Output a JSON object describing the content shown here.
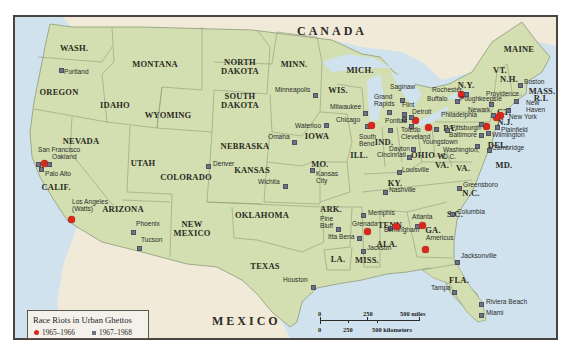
{
  "legend": {
    "title": "Race Riots in Urban Ghettos",
    "items": [
      {
        "label": "1965–1966",
        "marker": "red-dot",
        "color": "#d8271d"
      },
      {
        "label": "1967–1968",
        "marker": "gray-square",
        "color": "#6e7384"
      }
    ]
  },
  "scale": {
    "miles": [
      "0",
      "250",
      "500 miles"
    ],
    "kilometers": [
      "0",
      "250",
      "500 kilometers"
    ]
  },
  "countries": {
    "canada": "CANADA",
    "mexico": "MEXICO"
  },
  "colors": {
    "land": "#d3dfb0",
    "water": "#cfe2ee",
    "foreign_land": "#f1ead8",
    "riot_1965_1966": "#d8271d",
    "riot_1967_1968": "#6e7384"
  },
  "states": [
    {
      "id": "wash",
      "label": "WASH.",
      "x": 72,
      "y": 46
    },
    {
      "id": "oregon",
      "label": "OREGON",
      "x": 57,
      "y": 90
    },
    {
      "id": "idaho",
      "label": "IDAHO",
      "x": 113,
      "y": 103
    },
    {
      "id": "montana",
      "label": "MONTANA",
      "x": 153,
      "y": 62
    },
    {
      "id": "wyoming",
      "label": "WYOMING",
      "x": 166,
      "y": 113
    },
    {
      "id": "north-dakota",
      "label": "NORTH\nDAKOTA",
      "x": 238,
      "y": 60
    },
    {
      "id": "south-dakota",
      "label": "SOUTH\nDAKOTA",
      "x": 238,
      "y": 94
    },
    {
      "id": "minn",
      "label": "MINN.",
      "x": 292,
      "y": 62
    },
    {
      "id": "wis",
      "label": "WIS.",
      "x": 336,
      "y": 88
    },
    {
      "id": "mich",
      "label": "MICH.",
      "x": 358,
      "y": 68
    },
    {
      "id": "nevada",
      "label": "NEVADA",
      "x": 79,
      "y": 139
    },
    {
      "id": "calif",
      "label": "CALIF.",
      "x": 54,
      "y": 185
    },
    {
      "id": "utah",
      "label": "UTAH",
      "x": 141,
      "y": 161
    },
    {
      "id": "colorado",
      "label": "COLORADO",
      "x": 184,
      "y": 175
    },
    {
      "id": "arizona",
      "label": "ARIZONA",
      "x": 121,
      "y": 207
    },
    {
      "id": "new-mexico",
      "label": "NEW\nMEXICO",
      "x": 190,
      "y": 222
    },
    {
      "id": "nebraska",
      "label": "NEBRASKA",
      "x": 243,
      "y": 144
    },
    {
      "id": "iowa",
      "label": "IOWA",
      "x": 315,
      "y": 134
    },
    {
      "id": "kansas",
      "label": "KANSAS",
      "x": 250,
      "y": 168
    },
    {
      "id": "mo",
      "label": "MO.",
      "x": 318,
      "y": 162
    },
    {
      "id": "oklahoma",
      "label": "OKLAHOMA",
      "x": 260,
      "y": 213
    },
    {
      "id": "texas",
      "label": "TEXAS",
      "x": 263,
      "y": 264
    },
    {
      "id": "ark",
      "label": "ARK.",
      "x": 329,
      "y": 207
    },
    {
      "id": "la",
      "label": "LA.",
      "x": 336,
      "y": 257
    },
    {
      "id": "miss",
      "label": "MISS.",
      "x": 365,
      "y": 258
    },
    {
      "id": "ill",
      "label": "ILL.",
      "x": 357,
      "y": 153
    },
    {
      "id": "ind",
      "label": "IND.",
      "x": 382,
      "y": 140
    },
    {
      "id": "ohio",
      "label": "OHIO",
      "x": 421,
      "y": 153
    },
    {
      "id": "ky",
      "label": "KY.",
      "x": 393,
      "y": 181
    },
    {
      "id": "tenn",
      "label": "TENN.",
      "x": 389,
      "y": 223
    },
    {
      "id": "ala",
      "label": "ALA.",
      "x": 385,
      "y": 242
    },
    {
      "id": "ga",
      "label": "GA.",
      "x": 431,
      "y": 228
    },
    {
      "id": "w-va",
      "label": "W.\nVA.",
      "x": 440,
      "y": 154
    },
    {
      "id": "va",
      "label": "VA.",
      "x": 461,
      "y": 166
    },
    {
      "id": "nc",
      "label": "N.C.",
      "x": 469,
      "y": 191
    },
    {
      "id": "sc",
      "label": "S.C.",
      "x": 453,
      "y": 212
    },
    {
      "id": "fla",
      "label": "FLA.",
      "x": 457,
      "y": 278
    },
    {
      "id": "pa",
      "label": "PA.",
      "x": 448,
      "y": 126
    },
    {
      "id": "ny",
      "label": "N.Y.",
      "x": 464,
      "y": 83
    },
    {
      "id": "vt",
      "label": "VT.",
      "x": 498,
      "y": 68
    },
    {
      "id": "nh",
      "label": "N.H.",
      "x": 507,
      "y": 77
    },
    {
      "id": "maine",
      "label": "MAINE",
      "x": 517,
      "y": 47
    },
    {
      "id": "mass",
      "label": "MASS.",
      "x": 540,
      "y": 89
    },
    {
      "id": "ri",
      "label": "R.I.",
      "x": 539,
      "y": 96
    },
    {
      "id": "ct",
      "label": "CT.",
      "x": 502,
      "y": 110
    },
    {
      "id": "nj",
      "label": "N.J.",
      "x": 503,
      "y": 120
    },
    {
      "id": "del",
      "label": "DEL.",
      "x": 496,
      "y": 143
    },
    {
      "id": "md",
      "label": "MD.",
      "x": 502,
      "y": 163
    }
  ],
  "cities": [
    {
      "name": "Portland",
      "x": 59,
      "y": 68,
      "period": "1967–1968",
      "lx": 62,
      "ly": 70
    },
    {
      "name": "San Francisco",
      "x": 36,
      "y": 162,
      "period": "1967–1968",
      "lx": 36,
      "ly": 148
    },
    {
      "name": "Oakland",
      "x": 42,
      "y": 161,
      "period": "1965–1966",
      "lx": 50,
      "ly": 155
    },
    {
      "name": "Oakland-b",
      "x": 47,
      "y": 162,
      "period": "1967–1968",
      "lx": null,
      "ly": null
    },
    {
      "name": "Palo Alto",
      "x": 39,
      "y": 167,
      "period": "1967–1968",
      "lx": 43,
      "ly": 172
    },
    {
      "name": "Los Angeles\n(Watts)",
      "x": 69,
      "y": 217,
      "period": "1965–1966",
      "lx": 70,
      "ly": 200
    },
    {
      "name": "Phoenix",
      "x": 131,
      "y": 230,
      "period": "1967–1968",
      "lx": 134,
      "ly": 222
    },
    {
      "name": "Tucson",
      "x": 137,
      "y": 246,
      "period": "1967–1968",
      "lx": 139,
      "ly": 238
    },
    {
      "name": "Denver",
      "x": 206,
      "y": 164,
      "period": "1967–1968",
      "lx": 211,
      "ly": 162
    },
    {
      "name": "Wichita",
      "x": 283,
      "y": 184,
      "period": "1967–1968",
      "lx": 256,
      "ly": 180
    },
    {
      "name": "Kansas\nCity",
      "x": 310,
      "y": 168,
      "period": "1967–1968",
      "lx": 314,
      "ly": 172
    },
    {
      "name": "Omaha",
      "x": 292,
      "y": 140,
      "period": "1967–1968",
      "lx": 266,
      "ly": 135
    },
    {
      "name": "Waterloo",
      "x": 324,
      "y": 123,
      "period": "1967–1968",
      "lx": 293,
      "ly": 124
    },
    {
      "name": "Minneapolis",
      "x": 313,
      "y": 93,
      "period": "1967–1968",
      "lx": 273,
      "ly": 88
    },
    {
      "name": "Milwaukee",
      "x": 363,
      "y": 111,
      "period": "1967–1968",
      "lx": 328,
      "ly": 105
    },
    {
      "name": "Chicago",
      "x": 365,
      "y": 124,
      "period": "1967–1968",
      "lx": 334,
      "ly": 118
    },
    {
      "name": "Chicago-b",
      "x": 369,
      "y": 123,
      "period": "1965–1966",
      "lx": null,
      "ly": null
    },
    {
      "name": "South\nBend",
      "x": 388,
      "y": 128,
      "period": "1967–1968",
      "lx": 357,
      "ly": 135
    },
    {
      "name": "Grand\nRapids",
      "x": 387,
      "y": 110,
      "period": "1967–1968",
      "lx": 372,
      "ly": 95
    },
    {
      "name": "Saginaw",
      "x": 400,
      "y": 98,
      "period": "1967–1968",
      "lx": 388,
      "ly": 85
    },
    {
      "name": "Flint",
      "x": 402,
      "y": 112,
      "period": "1967–1968",
      "lx": 400,
      "ly": 103
    },
    {
      "name": "Pontiac",
      "x": 402,
      "y": 117,
      "period": "1967–1968",
      "lx": 383,
      "ly": 119
    },
    {
      "name": "Detroit",
      "x": 413,
      "y": 118,
      "period": "1965–1966",
      "lx": 410,
      "ly": 110
    },
    {
      "name": "Detroit-b",
      "x": 409,
      "y": 115,
      "period": "1967–1968",
      "lx": null,
      "ly": null
    },
    {
      "name": "Toledo",
      "x": 409,
      "y": 124,
      "period": "1967–1968",
      "lx": 399,
      "ly": 128
    },
    {
      "name": "Cleveland",
      "x": 426,
      "y": 125,
      "period": "1965–1966",
      "lx": 399,
      "ly": 135
    },
    {
      "name": "Youngstown",
      "x": 434,
      "y": 127,
      "period": "1967–1968",
      "lx": 420,
      "ly": 140
    },
    {
      "name": "Dayton",
      "x": 411,
      "y": 147,
      "period": "1967–1968",
      "lx": 387,
      "ly": 147
    },
    {
      "name": "Cincinnati",
      "x": 407,
      "y": 155,
      "period": "1967–1968",
      "lx": 375,
      "ly": 153
    },
    {
      "name": "Louisville",
      "x": 397,
      "y": 170,
      "period": "1967–1968",
      "lx": 400,
      "ly": 168
    },
    {
      "name": "Nashville",
      "x": 383,
      "y": 190,
      "period": "1967–1968",
      "lx": 387,
      "ly": 188
    },
    {
      "name": "Memphis",
      "x": 361,
      "y": 213,
      "period": "1967–1968",
      "lx": 366,
      "ly": 211
    },
    {
      "name": "Grenada",
      "x": 365,
      "y": 229,
      "period": "1965–1966",
      "lx": 350,
      "ly": 222
    },
    {
      "name": "Pine\nBluff",
      "x": 336,
      "y": 227,
      "period": "1967–1968",
      "lx": 318,
      "ly": 217
    },
    {
      "name": "Itta Bena",
      "x": 357,
      "y": 236,
      "period": "1967–1968",
      "lx": 326,
      "ly": 235
    },
    {
      "name": "Jackson",
      "x": 361,
      "y": 249,
      "period": "1967–1968",
      "lx": 365,
      "ly": 246
    },
    {
      "name": "Birmingham",
      "x": 388,
      "y": 226,
      "period": "1967–1968",
      "lx": 382,
      "ly": 228
    },
    {
      "name": "Birmingham-b",
      "x": 394,
      "y": 224,
      "period": "1965–1966",
      "lx": null,
      "ly": null
    },
    {
      "name": "Atlanta",
      "x": 415,
      "y": 224,
      "period": "1967–1968",
      "lx": 410,
      "ly": 215
    },
    {
      "name": "Atlanta-b",
      "x": 420,
      "y": 223,
      "period": "1965–1966",
      "lx": null,
      "ly": null
    },
    {
      "name": "Americus",
      "x": 423,
      "y": 247,
      "period": "1965–1966",
      "lx": 424,
      "ly": 236
    },
    {
      "name": "Columbia",
      "x": 450,
      "y": 212,
      "period": "1967–1968",
      "lx": 455,
      "ly": 210
    },
    {
      "name": "Greensboro",
      "x": 457,
      "y": 186,
      "period": "1967–1968",
      "lx": 461,
      "ly": 183
    },
    {
      "name": "Jacksonville",
      "x": 455,
      "y": 260,
      "period": "1967–1968",
      "lx": 459,
      "ly": 254
    },
    {
      "name": "Tampa",
      "x": 452,
      "y": 290,
      "period": "1967–1968",
      "lx": 429,
      "ly": 286
    },
    {
      "name": "Riviera Beach",
      "x": 479,
      "y": 302,
      "period": "1967–1968",
      "lx": 484,
      "ly": 300
    },
    {
      "name": "Miami",
      "x": 479,
      "y": 313,
      "period": "1967–1968",
      "lx": 484,
      "ly": 311
    },
    {
      "name": "Houston",
      "x": 311,
      "y": 285,
      "period": "1967–1968",
      "lx": 281,
      "ly": 278
    },
    {
      "name": "Rochester",
      "x": 459,
      "y": 92,
      "period": "1965–1966",
      "lx": 430,
      "ly": 88
    },
    {
      "name": "Rochester-b",
      "x": 464,
      "y": 92,
      "period": "1967–1968",
      "lx": null,
      "ly": null
    },
    {
      "name": "Buffalo",
      "x": 455,
      "y": 99,
      "period": "1967–1968",
      "lx": 425,
      "ly": 97
    },
    {
      "name": "Poughkeepsie",
      "x": 489,
      "y": 102,
      "period": "1967–1968",
      "lx": 458,
      "ly": 97
    },
    {
      "name": "Providence",
      "x": 514,
      "y": 99,
      "period": "1967–1968",
      "lx": 484,
      "ly": 92
    },
    {
      "name": "Boston",
      "x": 518,
      "y": 83,
      "period": "1967–1968",
      "lx": 522,
      "ly": 80
    },
    {
      "name": "New\nHaven",
      "x": 506,
      "y": 108,
      "period": "1967–1968",
      "lx": 524,
      "ly": 101
    },
    {
      "name": "New York",
      "x": 498,
      "y": 113,
      "period": "1965–1966",
      "lx": 507,
      "ly": 115
    },
    {
      "name": "New York-b",
      "x": 494,
      "y": 115,
      "period": "1965–1966",
      "lx": null,
      "ly": null
    },
    {
      "name": "Newark",
      "x": 491,
      "y": 113,
      "period": "1967–1968",
      "lx": 466,
      "ly": 108
    },
    {
      "name": "Philadelphia",
      "x": 484,
      "y": 124,
      "period": "1965–1966",
      "lx": 439,
      "ly": 113
    },
    {
      "name": "Philadelphia-b",
      "x": 479,
      "y": 122,
      "period": "1967–1968",
      "lx": null,
      "ly": null
    },
    {
      "name": "Plainfield",
      "x": 495,
      "y": 125,
      "period": "1967–1968",
      "lx": 499,
      "ly": 128
    },
    {
      "name": "Pittsburgh",
      "x": 445,
      "y": 128,
      "period": "1967–1968",
      "lx": 449,
      "ly": 126
    },
    {
      "name": "Baltimore",
      "x": 479,
      "y": 133,
      "period": "1967–1968",
      "lx": 447,
      "ly": 133
    },
    {
      "name": "Wilmington",
      "x": 486,
      "y": 131,
      "period": "1967–1968",
      "lx": 490,
      "ly": 133
    },
    {
      "name": "Washington,\nD.C.",
      "x": 475,
      "y": 144,
      "period": "1967–1968",
      "lx": 441,
      "ly": 148
    },
    {
      "name": "Cambridge",
      "x": 487,
      "y": 148,
      "period": "1967–1968",
      "lx": 490,
      "ly": 146
    }
  ]
}
